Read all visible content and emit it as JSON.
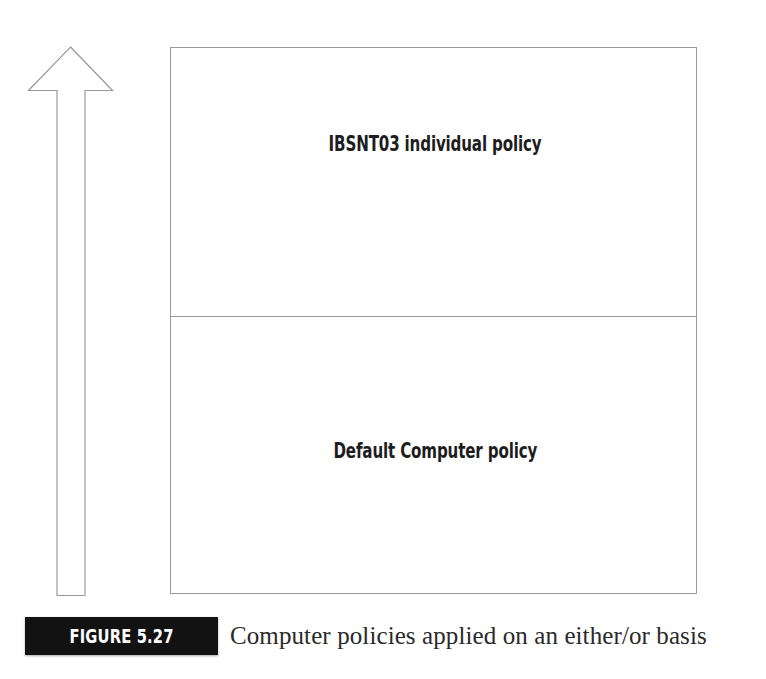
{
  "figure": {
    "tag_label": "FIGURE 5.27",
    "caption": "Computer policies applied on an either/or basis",
    "tag_background_color": "#121212",
    "tag_text_color": "#ffffff",
    "caption_text_color": "#2a2a2a"
  },
  "diagram": {
    "type": "stacked-precedence-diagram",
    "outline_color": "#9a9a9a",
    "background_color": "#ffffff",
    "arrow": {
      "icon_name": "up-arrow-outline",
      "direction": "up",
      "fill": "none",
      "stroke_color": "#9a9a9a",
      "meaning": "increasing precedence"
    },
    "sections": [
      {
        "label": "IBSNT03 individual policy",
        "position": "top"
      },
      {
        "label": "Default Computer policy",
        "position": "bottom"
      }
    ]
  }
}
